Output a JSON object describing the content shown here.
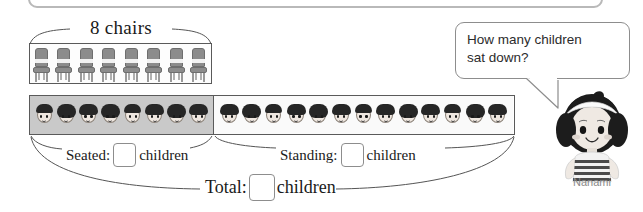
{
  "worksheet": {
    "chairs_caption": "8 chairs",
    "chairs_count": 8,
    "seated_count": 8,
    "standing_count": 13
  },
  "answers": {
    "seated": {
      "label": "Seated:",
      "value": "",
      "unit": "children"
    },
    "standing": {
      "label": "Standing:",
      "value": "",
      "unit": "children"
    },
    "total": {
      "label": "Total:",
      "value": "",
      "unit": "children"
    }
  },
  "speech": {
    "line1": "How many children",
    "line2": "sat down?"
  },
  "character": {
    "name": "Nanami"
  },
  "icons": {
    "chair": "chair-icon",
    "face": "child-face-icon"
  },
  "colors": {
    "seated_fill": "#c9c9c9",
    "standing_fill": "#fafafa",
    "outline": "#5a5a5a",
    "bubble_border": "#8d8d8d",
    "name_text": "#8a8a8a",
    "chair_gray": "#8c8c8c"
  }
}
